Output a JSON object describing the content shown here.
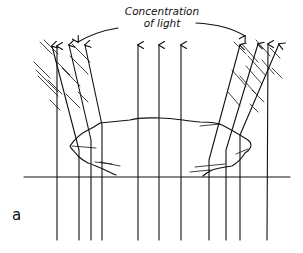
{
  "annotation": {
    "line1": "Concentration",
    "line2": "of light"
  },
  "figure_label": "a",
  "colors": {
    "ink": "#111111",
    "background": "#ffffff"
  }
}
